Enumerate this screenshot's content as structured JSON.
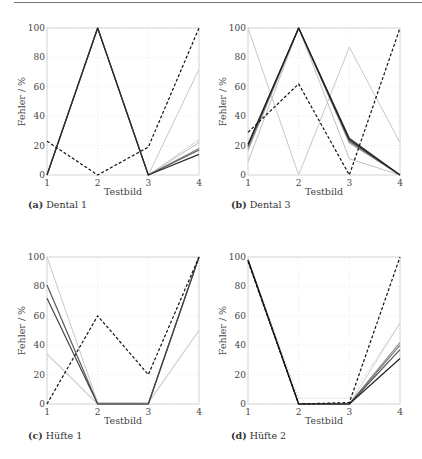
{
  "chart_data": [
    {
      "type": "line",
      "id": "a",
      "caption_tag": "(a)",
      "title": "Dental 1",
      "xlabel": "Testbild",
      "ylabel": "Fehler / %",
      "x": [
        1,
        2,
        3,
        4
      ],
      "xticks": [
        "1",
        "2",
        "3",
        "4"
      ],
      "yticks": [
        "0",
        "20",
        "40",
        "60",
        "80",
        "100"
      ],
      "ylim": [
        0,
        100
      ],
      "grid": true,
      "series": [
        {
          "name": "light-1",
          "values": [
            0,
            100,
            0,
            72
          ],
          "color": "#c8c8c8",
          "width": 1,
          "dash": ""
        },
        {
          "name": "light-2",
          "values": [
            0,
            100,
            0,
            24
          ],
          "color": "#d0d0d0",
          "width": 1,
          "dash": ""
        },
        {
          "name": "mid-1",
          "values": [
            0,
            100,
            0,
            22
          ],
          "color": "#bdbdbd",
          "width": 1,
          "dash": ""
        },
        {
          "name": "mid-2",
          "values": [
            0,
            100,
            0,
            18
          ],
          "color": "#8a8a8a",
          "width": 1.2,
          "dash": ""
        },
        {
          "name": "dark-1",
          "values": [
            0,
            100,
            0,
            17
          ],
          "color": "#5a5a5a",
          "width": 1.2,
          "dash": ""
        },
        {
          "name": "dark-2",
          "values": [
            0,
            100,
            0,
            14
          ],
          "color": "#2a2a2a",
          "width": 1.2,
          "dash": ""
        },
        {
          "name": "reference-dashed",
          "values": [
            23,
            0,
            19,
            100
          ],
          "color": "#111111",
          "width": 1.2,
          "dash": "3,2"
        }
      ]
    },
    {
      "type": "line",
      "id": "b",
      "caption_tag": "(b)",
      "title": "Dental 3",
      "xlabel": "Testbild",
      "ylabel": "Fehler / %",
      "x": [
        1,
        2,
        3,
        4
      ],
      "xticks": [
        "1",
        "2",
        "3",
        "4"
      ],
      "yticks": [
        "0",
        "20",
        "40",
        "60",
        "80",
        "100"
      ],
      "ylim": [
        0,
        100
      ],
      "grid": true,
      "series": [
        {
          "name": "light-down",
          "values": [
            100,
            0,
            87,
            22
          ],
          "color": "#c8c8c8",
          "width": 1,
          "dash": ""
        },
        {
          "name": "light-up",
          "values": [
            9,
            100,
            11,
            0
          ],
          "color": "#c0c0c0",
          "width": 1,
          "dash": ""
        },
        {
          "name": "mid-1",
          "values": [
            17,
            100,
            22,
            0
          ],
          "color": "#9a9a9a",
          "width": 1.2,
          "dash": ""
        },
        {
          "name": "mid-2",
          "values": [
            19,
            100,
            23,
            0
          ],
          "color": "#6a6a6a",
          "width": 1.2,
          "dash": ""
        },
        {
          "name": "dark-1",
          "values": [
            20,
            100,
            25,
            0
          ],
          "color": "#3a3a3a",
          "width": 1.2,
          "dash": ""
        },
        {
          "name": "dark-2",
          "values": [
            21,
            100,
            24,
            0
          ],
          "color": "#222222",
          "width": 1.2,
          "dash": ""
        },
        {
          "name": "reference-dashed",
          "values": [
            29,
            62,
            0,
            100
          ],
          "color": "#111111",
          "width": 1.2,
          "dash": "3,2"
        }
      ]
    },
    {
      "type": "line",
      "id": "c",
      "caption_tag": "(c)",
      "title": "Hüfte 1",
      "xlabel": "Testbild",
      "ylabel": "Fehler / %",
      "x": [
        1,
        2,
        3,
        4
      ],
      "xticks": [
        "1",
        "2",
        "3",
        "4"
      ],
      "yticks": [
        "0",
        "20",
        "40",
        "60",
        "80",
        "100"
      ],
      "ylim": [
        0,
        100
      ],
      "grid": true,
      "series": [
        {
          "name": "light-1",
          "values": [
            100,
            1,
            1,
            100
          ],
          "color": "#c8c8c8",
          "width": 1,
          "dash": ""
        },
        {
          "name": "light-2",
          "values": [
            34,
            0,
            1,
            50
          ],
          "color": "#cfcfcf",
          "width": 1.2,
          "dash": ""
        },
        {
          "name": "mid-1",
          "values": [
            81,
            0,
            0,
            100
          ],
          "color": "#5a5a5a",
          "width": 1.2,
          "dash": ""
        },
        {
          "name": "dark-1",
          "values": [
            72,
            0,
            0,
            100
          ],
          "color": "#444444",
          "width": 1.2,
          "dash": ""
        },
        {
          "name": "reference-dashed",
          "values": [
            0,
            60,
            20,
            100
          ],
          "color": "#111111",
          "width": 1.2,
          "dash": "3,2"
        }
      ]
    },
    {
      "type": "line",
      "id": "d",
      "caption_tag": "(d)",
      "title": "Hüfte 2",
      "xlabel": "Testbild",
      "ylabel": "Fehler / %",
      "x": [
        1,
        2,
        3,
        4
      ],
      "xticks": [
        "1",
        "2",
        "3",
        "4"
      ],
      "yticks": [
        "0",
        "20",
        "40",
        "60",
        "80",
        "100"
      ],
      "ylim": [
        0,
        100
      ],
      "grid": true,
      "series": [
        {
          "name": "light-dotted",
          "values": [
            99,
            4,
            4,
            55
          ],
          "color": "#d0d0d0",
          "width": 1,
          "dash": "1,1"
        },
        {
          "name": "light-1",
          "values": [
            98,
            0,
            0,
            55
          ],
          "color": "#cccccc",
          "width": 1,
          "dash": ""
        },
        {
          "name": "mid-1",
          "values": [
            98,
            0,
            0,
            42
          ],
          "color": "#9a9a9a",
          "width": 1.2,
          "dash": ""
        },
        {
          "name": "mid-2",
          "values": [
            98,
            0,
            0,
            40
          ],
          "color": "#7a7a7a",
          "width": 1.2,
          "dash": ""
        },
        {
          "name": "dark-1",
          "values": [
            98,
            0,
            0,
            37
          ],
          "color": "#555555",
          "width": 1.2,
          "dash": ""
        },
        {
          "name": "dark-2",
          "values": [
            98,
            0,
            0,
            31
          ],
          "color": "#222222",
          "width": 1.2,
          "dash": ""
        },
        {
          "name": "reference-dashed",
          "values": [
            97,
            0,
            1,
            100
          ],
          "color": "#111111",
          "width": 1.2,
          "dash": "3,2"
        }
      ]
    }
  ]
}
